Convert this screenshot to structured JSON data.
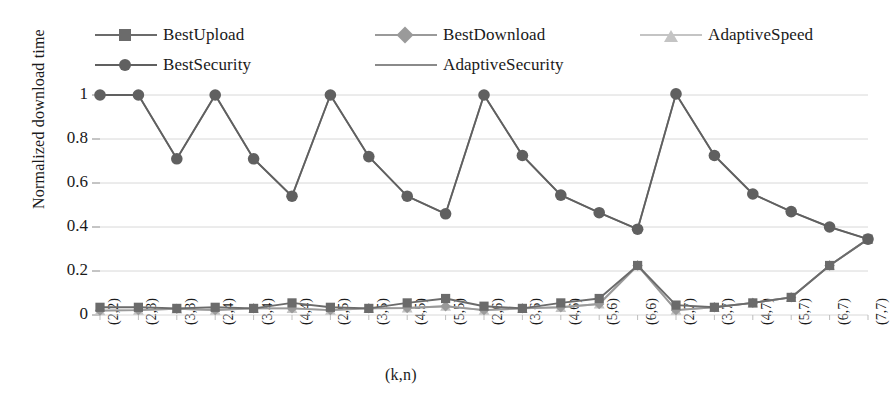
{
  "chart_data": {
    "type": "line",
    "title": "",
    "xlabel": "(k,n)",
    "ylabel": "Normalized download time",
    "ylim": [
      0,
      1
    ],
    "yticks": [
      "0",
      "0.2",
      "0.4",
      "0.6",
      "0.8",
      "1"
    ],
    "grid": true,
    "legend_position": "top",
    "categories": [
      "(2,2)",
      "(2,3)",
      "(3,3)",
      "(2,4)",
      "(3,4)",
      "(4,4)",
      "(2,5)",
      "(3,5)",
      "(4,5)",
      "(5,5)",
      "(2,6)",
      "(3,6)",
      "(4,6)",
      "(5,6)",
      "(6,6)",
      "(2,7)",
      "(3,7)",
      "(4,7)",
      "(5,7)",
      "(6,7)",
      "(7,7)"
    ],
    "series": [
      {
        "name": "BestUpload",
        "marker": "square",
        "color": "#6b6b6b",
        "values": [
          0.035,
          0.035,
          0.03,
          0.035,
          0.03,
          0.055,
          0.035,
          0.03,
          0.055,
          0.075,
          0.04,
          0.03,
          0.055,
          0.075,
          0.225,
          0.045,
          0.035,
          0.055,
          0.08,
          0.225,
          0.345
        ]
      },
      {
        "name": "BestDownload",
        "marker": "diamond",
        "color": "#9a9a9a",
        "values": [
          0.02,
          0.022,
          0.028,
          0.022,
          0.03,
          0.03,
          0.022,
          0.03,
          0.032,
          0.04,
          0.022,
          0.03,
          0.035,
          0.05,
          0.225,
          0.022,
          0.035,
          0.055,
          0.08,
          0.225,
          0.345
        ]
      },
      {
        "name": "AdaptiveSpeed",
        "marker": "triangle",
        "color": "#c4c4c4",
        "values": [
          0.02,
          0.022,
          0.028,
          0.022,
          0.03,
          0.03,
          0.022,
          0.03,
          0.032,
          0.04,
          0.022,
          0.03,
          0.035,
          0.05,
          0.225,
          0.022,
          0.035,
          0.055,
          0.08,
          0.225,
          0.345
        ]
      },
      {
        "name": "BestSecurity",
        "marker": "circle",
        "color": "#606060",
        "values": [
          1.0,
          1.0,
          0.71,
          1.0,
          0.71,
          0.54,
          1.0,
          0.72,
          0.54,
          0.46,
          1.0,
          0.725,
          0.545,
          0.465,
          0.39,
          1.005,
          0.725,
          0.55,
          0.47,
          0.4,
          0.345
        ]
      },
      {
        "name": "AdaptiveSecurity",
        "marker": "none",
        "color": "#8a8a8a",
        "values": [
          1.0,
          1.0,
          0.71,
          1.0,
          0.71,
          0.54,
          1.0,
          0.72,
          0.54,
          0.46,
          1.0,
          0.725,
          0.545,
          0.465,
          0.39,
          1.005,
          0.725,
          0.55,
          0.47,
          0.4,
          0.345
        ]
      }
    ]
  },
  "legend": {
    "row1": [
      {
        "label": "BestUpload",
        "marker": "square",
        "color": "#6b6b6b"
      },
      {
        "label": "BestDownload",
        "marker": "diamond",
        "color": "#9a9a9a"
      },
      {
        "label": "AdaptiveSpeed",
        "marker": "triangle",
        "color": "#c4c4c4"
      }
    ],
    "row2": [
      {
        "label": "BestSecurity",
        "marker": "circle",
        "color": "#606060"
      },
      {
        "label": "AdaptiveSecurity",
        "marker": "none",
        "color": "#8a8a8a"
      }
    ]
  },
  "style": {
    "grid_color": "#d8d8d8",
    "axis_color": "#8a8a8a",
    "text_color": "#1a1a1a",
    "background": "#ffffff"
  }
}
